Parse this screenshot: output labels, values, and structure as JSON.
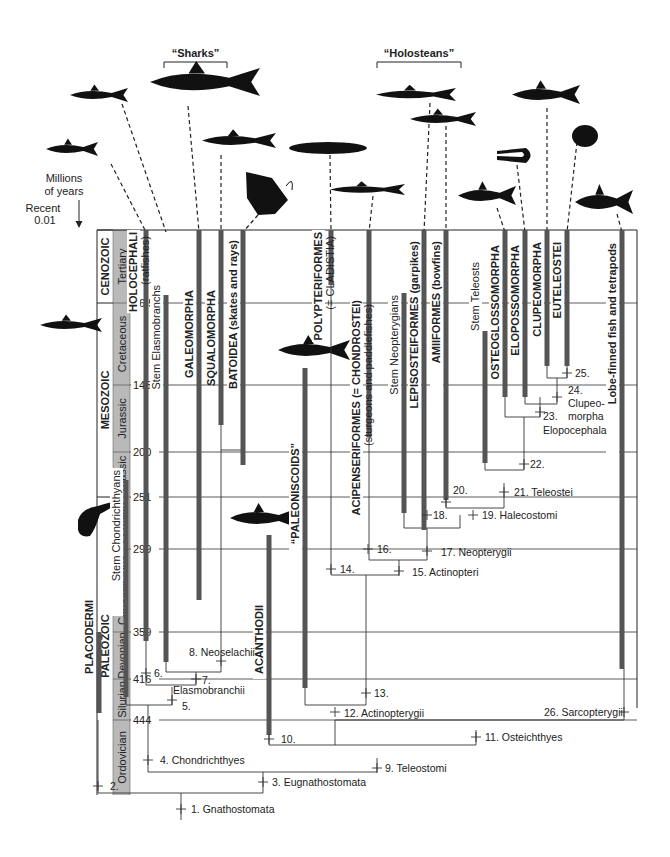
{
  "time_axis": {
    "header": [
      "Millions",
      "of years"
    ],
    "recent_label": "Recent",
    "recent_value": "0.01",
    "ticks": [
      {
        "value": "66.5",
        "y": 303
      },
      {
        "value": "145",
        "y": 385
      },
      {
        "value": "200",
        "y": 452
      },
      {
        "value": "251",
        "y": 497
      },
      {
        "value": "299",
        "y": 549
      },
      {
        "value": "359",
        "y": 632
      },
      {
        "value": "416",
        "y": 679
      },
      {
        "value": "444",
        "y": 720
      }
    ],
    "eras": [
      {
        "name": "CENOZOIC",
        "y1": 230,
        "y2": 303
      },
      {
        "name": "MESOZOIC",
        "y1": 303,
        "y2": 497
      },
      {
        "name": "PALEOZOIC",
        "y1": 497,
        "y2": 795
      }
    ],
    "periods": [
      {
        "name": "Tertiary",
        "y1": 230,
        "y2": 303
      },
      {
        "name": "Cretaceous",
        "y1": 303,
        "y2": 385
      },
      {
        "name": "Jurassic",
        "y1": 385,
        "y2": 452
      },
      {
        "name": "Triassic",
        "y1": 452,
        "y2": 497
      },
      {
        "name": "Permian",
        "y1": 497,
        "y2": 549
      },
      {
        "name": "Carboniferous",
        "y1": 549,
        "y2": 632
      },
      {
        "name": "Devonian",
        "y1": 632,
        "y2": 679
      },
      {
        "name": "Silurian",
        "y1": 679,
        "y2": 720
      },
      {
        "name": "Ordovician",
        "y1": 720,
        "y2": 795
      }
    ]
  },
  "group_brackets": [
    {
      "label": "“Sharks”",
      "x1": 164,
      "x2": 227,
      "y": 62
    },
    {
      "label": "“Holosteans”",
      "x1": 377,
      "x2": 461,
      "y": 62
    }
  ],
  "taxa": [
    {
      "name": "PLACODERMI",
      "sub": "",
      "x": 99,
      "y_top": 632,
      "y_bot": 713,
      "label_y": 600
    },
    {
      "name": "Stem Chondrichthyans",
      "sub": "",
      "x": 126,
      "y_top": 480,
      "y_bot": 697,
      "label_y": 470,
      "plain": true
    },
    {
      "name": "HOLOCEPHALI",
      "sub": "(ratfishes)",
      "x": 146,
      "y_top": 230,
      "y_bot": 641,
      "label_y": 232
    },
    {
      "name": "Stem Elasmobranchs",
      "sub": "",
      "x": 166,
      "y_top": 295,
      "y_bot": 662,
      "label_y": 285,
      "plain": true
    },
    {
      "name": "GALEOMORPHA",
      "sub": "",
      "x": 199,
      "y_top": 230,
      "y_bot": 600,
      "label_y": 290
    },
    {
      "name": "SQUALOMORPHA",
      "sub": "",
      "x": 221,
      "y_top": 230,
      "y_bot": 425,
      "label_y": 290
    },
    {
      "name": "BATOIDEA (skates and rays)",
      "sub": "",
      "x": 243,
      "y_top": 230,
      "y_bot": 465,
      "label_y": 240,
      "mixed": true
    },
    {
      "name": "ACANTHODII",
      "sub": "",
      "x": 269,
      "y_top": 535,
      "y_bot": 735,
      "label_y": 605
    },
    {
      "name": "“PALEONISCOIDS”",
      "sub": "",
      "x": 305,
      "y_top": 368,
      "y_bot": 688,
      "label_y": 443
    },
    {
      "name": "POLYPTERIFORMES",
      "sub": "(= CLADISTIA)",
      "x": 331,
      "y_top": 230,
      "y_bot": 285,
      "label_y": 232
    },
    {
      "name": "ACIPENSERIFORMES (= CHONDROSTEI)",
      "sub": "(sturgeons and paddlefishes)",
      "x": 369,
      "y_top": 230,
      "y_bot": 437,
      "label_y": 300
    },
    {
      "name": "Stem Neopterygians",
      "sub": "",
      "x": 404,
      "y_top": 293,
      "y_bot": 513,
      "label_y": 295,
      "plain": true
    },
    {
      "name": "LEPISOSTEIFORMES (garpikes)",
      "sub": "",
      "x": 424,
      "y_top": 230,
      "y_bot": 530,
      "label_y": 241,
      "mixed": true
    },
    {
      "name": "AMIIFORMES (bowfins)",
      "sub": "",
      "x": 446,
      "y_top": 230,
      "y_bot": 500,
      "label_y": 241,
      "mixed": true
    },
    {
      "name": "Stem Teleosts",
      "sub": "",
      "x": 485,
      "y_top": 331,
      "y_bot": 463,
      "label_y": 262,
      "plain": true
    },
    {
      "name": "OSTEOGLOSSOMORPHA",
      "sub": "",
      "x": 505,
      "y_top": 230,
      "y_bot": 397,
      "label_y": 245
    },
    {
      "name": "ELOPOSSOMORPHA",
      "sub": "",
      "x": 525,
      "y_top": 230,
      "y_bot": 397,
      "label_y": 245
    },
    {
      "name": "CLUPEOMORPHA",
      "sub": "",
      "x": 547,
      "y_top": 230,
      "y_bot": 366,
      "label_y": 242
    },
    {
      "name": "EUTELEOSTEI",
      "sub": "",
      "x": 567,
      "y_top": 230,
      "y_bot": 366,
      "label_y": 242
    },
    {
      "name": "Lobe-finned fish and tetrapods",
      "sub": "",
      "x": 622,
      "y_top": 230,
      "y_bot": 669,
      "label_y": 243,
      "mixed": true
    }
  ],
  "nodes": [
    {
      "id": "1.",
      "name": "Gnathostomata",
      "label": "1. Gnathostomata",
      "x": 181,
      "y": 809,
      "lx": 191,
      "ly": 813
    },
    {
      "id": "2.",
      "name": "",
      "label": "2.",
      "x": 98,
      "y": 786,
      "lx": 110,
      "ly": 790
    },
    {
      "id": "3.",
      "name": "Eugnathostomata",
      "label": "3. Eugnathostomata",
      "x": 263,
      "y": 782,
      "lx": 272,
      "ly": 786
    },
    {
      "id": "4.",
      "name": "Chondrichthyes",
      "label": "4. Chondrichthyes",
      "x": 148,
      "y": 760,
      "lx": 160,
      "ly": 764
    },
    {
      "id": "5.",
      "name": "",
      "label": "5.",
      "x": 172,
      "y": 700,
      "lx": 182,
      "ly": 710
    },
    {
      "id": "6.",
      "name": "",
      "label": "6.",
      "x": 146,
      "y": 673,
      "lx": 154,
      "ly": 677
    },
    {
      "id": "7.",
      "name": "",
      "label": "7.",
      "x": 196,
      "y": 679,
      "lx": 202,
      "ly": 684
    },
    {
      "id": "8.",
      "name": "Neoselachii",
      "label": "8. Neoselachii",
      "x": 221,
      "y": 661,
      "lx": 189,
      "ly": 656
    },
    {
      "id": "Elasmobranchii",
      "name": "Elasmobranchii",
      "label": "Elasmobranchii",
      "x": 0,
      "y": 0,
      "lx": 173,
      "ly": 694
    },
    {
      "id": "9.",
      "name": "Teleostomi",
      "label": "9. Teleostomi",
      "x": 377,
      "y": 768,
      "lx": 385,
      "ly": 772
    },
    {
      "id": "10.",
      "name": "",
      "label": "10.",
      "x": 269,
      "y": 739,
      "lx": 281,
      "ly": 743
    },
    {
      "id": "11.",
      "name": "Osteichthyes",
      "label": "11. Osteichthyes",
      "x": 476,
      "y": 737,
      "lx": 485,
      "ly": 741
    },
    {
      "id": "12.",
      "name": "Actinopterygii",
      "label": "12. Actinopterygii",
      "x": 335,
      "y": 712,
      "lx": 344,
      "ly": 717
    },
    {
      "id": "13.",
      "name": "",
      "label": "13.",
      "x": 366,
      "y": 693,
      "lx": 374,
      "ly": 697
    },
    {
      "id": "14.",
      "name": "",
      "label": "14.",
      "x": 331,
      "y": 569,
      "lx": 340,
      "ly": 573
    },
    {
      "id": "15.",
      "name": "Actinopteri",
      "label": "15. Actinopteri",
      "x": 399,
      "y": 571,
      "lx": 412,
      "ly": 576
    },
    {
      "id": "16.",
      "name": "",
      "label": "16.",
      "x": 368,
      "y": 549,
      "lx": 377,
      "ly": 553
    },
    {
      "id": "17.",
      "name": "Neopterygii",
      "label": "17. Neopterygii",
      "x": 427,
      "y": 551,
      "lx": 441,
      "ly": 556
    },
    {
      "id": "18.",
      "name": "",
      "label": "18.",
      "x": 427,
      "y": 515,
      "lx": 433,
      "ly": 519
    },
    {
      "id": "19.",
      "name": "Halecostomi",
      "label": "19. Halecostomi",
      "x": 473,
      "y": 515,
      "lx": 482,
      "ly": 519
    },
    {
      "id": "20.",
      "name": "",
      "label": "20.",
      "x": 446,
      "y": 502,
      "lx": 453,
      "ly": 494
    },
    {
      "id": "21.",
      "name": "Teleostei",
      "label": "21. Teleostei",
      "x": 504,
      "y": 492,
      "lx": 514,
      "ly": 496
    },
    {
      "id": "22.",
      "name": "",
      "label": "22.",
      "x": 524,
      "y": 464,
      "lx": 530,
      "ly": 468
    },
    {
      "id": "23.",
      "name": "Elopocephala",
      "label": "23.",
      "x": 540,
      "y": 412,
      "lx": 543,
      "ly": 420
    },
    {
      "id": "Elopocephala",
      "name": "Elopocephala",
      "label": "Elopocephala",
      "x": 0,
      "y": 0,
      "lx": 543,
      "ly": 434
    },
    {
      "id": "24.",
      "name": "Clupeomorpha",
      "label": "24.",
      "x": 557,
      "y": 397,
      "lx": 568,
      "ly": 394
    },
    {
      "id": "Clupeo",
      "name": "Clupeomorpha",
      "label": "Clupeo-",
      "x": 0,
      "y": 0,
      "lx": 568,
      "ly": 407
    },
    {
      "id": "morpha",
      "name": "Clupeomorpha",
      "label": "morpha",
      "x": 0,
      "y": 0,
      "lx": 568,
      "ly": 420
    },
    {
      "id": "25.",
      "name": "",
      "label": "25.",
      "x": 567,
      "y": 373,
      "lx": 575,
      "ly": 377
    },
    {
      "id": "26.",
      "name": "Sarcopterygii",
      "label": "26. Sarcopterygii",
      "x": 624,
      "y": 712,
      "lx": 544,
      "ly": 716
    }
  ],
  "silhouettes": [
    {
      "taxon": "Holocephali (ratfish)",
      "x": 70,
      "y": 148
    },
    {
      "taxon": "Stem Elasmobranch shark",
      "x": 98,
      "y": 95
    },
    {
      "taxon": "Galeomorph shark",
      "x": 160,
      "y": 90
    },
    {
      "taxon": "Squalomorph shark",
      "x": 220,
      "y": 140
    },
    {
      "taxon": "Batoid ray",
      "x": 248,
      "y": 175
    },
    {
      "taxon": "Polypteriform",
      "x": 316,
      "y": 145
    },
    {
      "taxon": "Acipenseriform sturgeon",
      "x": 358,
      "y": 188
    },
    {
      "taxon": "Lepisosteiform gar",
      "x": 416,
      "y": 91
    },
    {
      "taxon": "Amiiform bowfin",
      "x": 435,
      "y": 119
    },
    {
      "taxon": "Osteoglossomorph",
      "x": 485,
      "y": 194
    },
    {
      "taxon": "Elopomorph eel",
      "x": 512,
      "y": 153
    },
    {
      "taxon": "Clupeomorph",
      "x": 547,
      "y": 96
    },
    {
      "taxon": "Euteleost",
      "x": 587,
      "y": 134
    },
    {
      "taxon": "Coelacanth",
      "x": 606,
      "y": 199
    },
    {
      "taxon": "Stem chondrichthyan",
      "x": 60,
      "y": 326
    },
    {
      "taxon": "Paleoniscoid",
      "x": 292,
      "y": 353
    },
    {
      "taxon": "Acanthodian",
      "x": 266,
      "y": 520
    },
    {
      "taxon": "Placoderm",
      "x": 85,
      "y": 520
    }
  ]
}
